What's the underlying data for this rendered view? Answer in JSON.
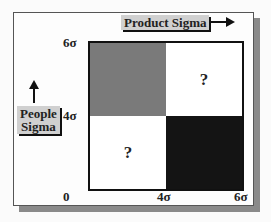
{
  "diagram": {
    "x_axis_label": "Product Sigma",
    "y_axis_label_line1": "People",
    "y_axis_label_line2": "Sigma",
    "y_ticks": [
      "6σ",
      "4σ"
    ],
    "x_ticks": [
      "0",
      "4σ",
      "6σ"
    ],
    "quadrants": {
      "top_left": {
        "label": "",
        "fill": "#7a7a7a"
      },
      "top_right": {
        "label": "?",
        "fill": "#ffffff"
      },
      "bottom_left": {
        "label": "?",
        "fill": "#ffffff"
      },
      "bottom_right": {
        "label": "",
        "fill": "#141414"
      }
    }
  }
}
